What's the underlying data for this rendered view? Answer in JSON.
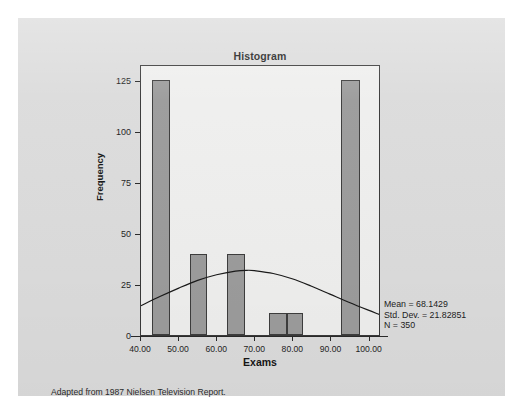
{
  "figure": {
    "title": "Histogram",
    "caption": "Adapted from 1987 Nielsen Television Report.",
    "background_color": "#dcdcdc",
    "plot_background_color": "#efefee",
    "bar_color": "#9c9c9c",
    "bar_border_color": "#3d3d3d",
    "curve_color": "#1a1a1a"
  },
  "stats": {
    "mean_label": "Mean = 68.1429",
    "stddev_label": "Std. Dev. = 21.82851",
    "n_label": "N = 350"
  },
  "chart_data": {
    "type": "bar",
    "title": "Histogram",
    "xlabel": "Exams",
    "ylabel": "Frequency",
    "xlim": [
      40,
      103
    ],
    "ylim": [
      0,
      133
    ],
    "grid": false,
    "legend": null,
    "xticks": [
      40,
      50,
      60,
      70,
      80,
      90,
      100
    ],
    "xtick_labels": [
      "40.00",
      "50.00",
      "60.00",
      "70.00",
      "80.00",
      "90.00",
      "100.00"
    ],
    "yticks": [
      0,
      25,
      50,
      75,
      100,
      125
    ],
    "ytick_labels": [
      "0",
      "25",
      "50",
      "75",
      "100",
      "125"
    ],
    "bars": [
      {
        "x_start": 42.8,
        "x_end": 47.6,
        "value": 125
      },
      {
        "x_start": 52.8,
        "x_end": 57.2,
        "value": 40
      },
      {
        "x_start": 62.6,
        "x_end": 67.2,
        "value": 40
      },
      {
        "x_start": 73.6,
        "x_end": 78.2,
        "value": 11
      },
      {
        "x_start": 78.2,
        "x_end": 82.6,
        "value": 11
      },
      {
        "x_start": 92.6,
        "x_end": 97.4,
        "value": 125
      }
    ],
    "normal_curve": {
      "mean": 68.1429,
      "stddev": 21.82851,
      "n": 350,
      "peak_value": 32,
      "points": [
        {
          "x": 40.0,
          "y": 14.5
        },
        {
          "x": 45.0,
          "y": 19.0
        },
        {
          "x": 50.0,
          "y": 23.2
        },
        {
          "x": 55.0,
          "y": 27.0
        },
        {
          "x": 60.0,
          "y": 29.8
        },
        {
          "x": 65.0,
          "y": 31.6
        },
        {
          "x": 68.1,
          "y": 32.0
        },
        {
          "x": 70.0,
          "y": 31.8
        },
        {
          "x": 75.0,
          "y": 30.4
        },
        {
          "x": 80.0,
          "y": 27.8
        },
        {
          "x": 85.0,
          "y": 24.2
        },
        {
          "x": 90.0,
          "y": 20.2
        },
        {
          "x": 95.0,
          "y": 16.2
        },
        {
          "x": 100.0,
          "y": 12.4
        },
        {
          "x": 103.0,
          "y": 10.2
        }
      ]
    }
  }
}
